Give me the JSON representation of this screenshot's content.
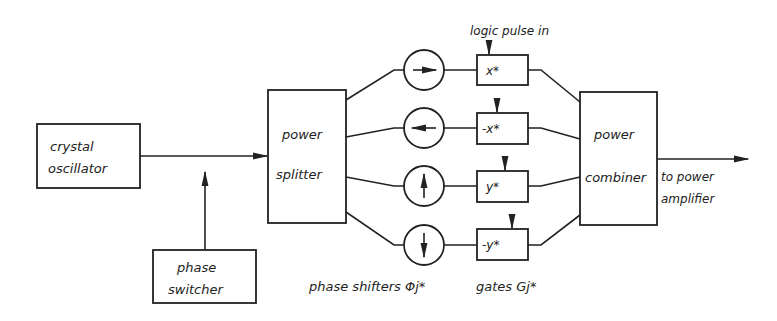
{
  "blocks": {
    "oscillator": {
      "line1": "crystal",
      "line2": "oscillator"
    },
    "phase_switcher": {
      "line1": "phase",
      "line2": "switcher"
    },
    "splitter": {
      "line1": "power",
      "line2": "splitter"
    },
    "combiner": {
      "line1": "power",
      "line2": "combiner"
    }
  },
  "output": {
    "line1": "to power",
    "line2": "amplifier"
  },
  "logic_pulse_label": "logic pulse in",
  "phase_shifters_label": "phase shifters Φj*",
  "gates_label": "gates Gj*",
  "branches": [
    {
      "arrow": "right",
      "gate": "x*"
    },
    {
      "arrow": "left",
      "gate": "-x*"
    },
    {
      "arrow": "up",
      "gate": "y*"
    },
    {
      "arrow": "down",
      "gate": "-y*"
    }
  ]
}
